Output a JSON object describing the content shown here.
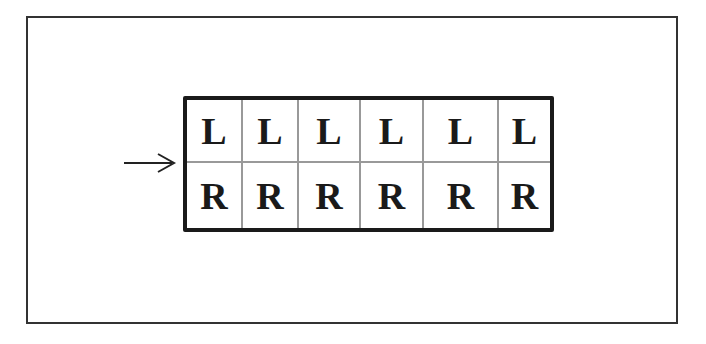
{
  "diagram": {
    "rows": [
      {
        "label": "top-row",
        "cells": [
          "L",
          "L",
          "L",
          "L",
          "L",
          "L"
        ]
      },
      {
        "label": "bottom-row",
        "cells": [
          "R",
          "R",
          "R",
          "R",
          "R",
          "R"
        ]
      }
    ],
    "pointer": {
      "icon": "right-arrow-icon",
      "points_to": "row-boundary"
    }
  }
}
